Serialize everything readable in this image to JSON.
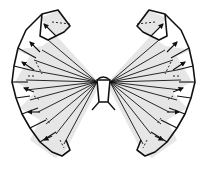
{
  "diagram": {
    "caption": "Folded butterfly with fanned wings",
    "colors": {
      "background": "#ffffff",
      "stroke": "#111111",
      "fill": "#e6e6e6"
    },
    "parts": {
      "left_wing": "left-wing",
      "right_wing": "right-wing",
      "body": "body"
    },
    "annotations": {
      "arrows_per_wing": 6,
      "dashed_fold_lines": true
    }
  }
}
